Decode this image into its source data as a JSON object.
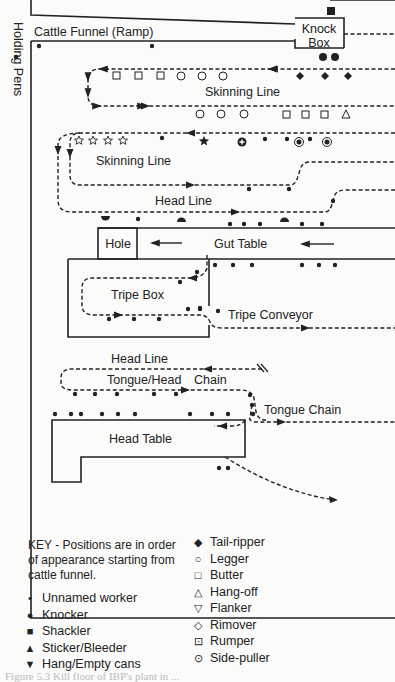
{
  "labels": {
    "holding_pens": "Holding Pens",
    "cattle_funnel": "Cattle Funnel (Ramp)",
    "knock_box": [
      "Knock",
      "Box"
    ],
    "skinning_line_1": "Skinning Line",
    "skinning_line_2": "Skinning Line",
    "head_line_1": "Head Line",
    "hole": "Hole",
    "gut_table": "Gut Table",
    "tripe_box": "Tripe Box",
    "tripe_conveyor": "Tripe Conveyor",
    "head_line_2": "Head Line",
    "tongue_head_chain": "Tongue/Head",
    "chain": "Chain",
    "tongue_chain": "Tongue Chain",
    "head_table": "Head Table"
  },
  "key": {
    "intro": "KEY - Positions are in order of appearance starting from cattle funnel.",
    "left": [
      {
        "symbol": "unnamed-worker",
        "glyph": "•",
        "label": "Unnamed worker"
      },
      {
        "symbol": "knocker",
        "glyph": "●",
        "label": "Knocker"
      },
      {
        "symbol": "shackler",
        "glyph": "■",
        "label": "Shackler"
      },
      {
        "symbol": "sticker-bleeder",
        "glyph": "▲",
        "label": "Sticker/Bleeder"
      },
      {
        "symbol": "hang-empty-cans",
        "glyph": "▼",
        "label": "Hang/Empty cans"
      }
    ],
    "right": [
      {
        "symbol": "tail-ripper",
        "glyph": "◆",
        "label": "Tail-ripper"
      },
      {
        "symbol": "legger",
        "glyph": "○",
        "label": "Legger"
      },
      {
        "symbol": "butter",
        "glyph": "□",
        "label": "Butter"
      },
      {
        "symbol": "hang-off",
        "glyph": "△",
        "label": "Hang-off"
      },
      {
        "symbol": "flanker",
        "glyph": "▽",
        "label": "Flanker"
      },
      {
        "symbol": "rimover",
        "glyph": "◇",
        "label": "Rimover"
      },
      {
        "symbol": "rumper",
        "glyph": "⊡",
        "label": "Rumper"
      },
      {
        "symbol": "side-puller",
        "glyph": "⊙",
        "label": "Side-puller"
      }
    ]
  },
  "caption": "Figure 5.3 Kill floor of IBP's plant in ..."
}
